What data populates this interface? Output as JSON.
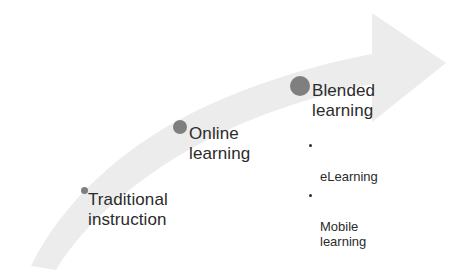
{
  "diagram": {
    "type": "curved-arrow-progression",
    "arrow": {
      "name": "upward-curved-arrow",
      "fill_color": "#ececec",
      "direction": "left-bottom to right-top",
      "tip_label": ""
    },
    "colors": {
      "arrow": "#ececec",
      "dot": "#7f7f7f",
      "text": "#2b2b2b",
      "background": "#ffffff"
    },
    "stages": [
      {
        "id": "traditional",
        "label": "Traditional\ninstruction",
        "dot_size": "small",
        "sub_items": []
      },
      {
        "id": "online",
        "label": "Online\nlearning",
        "dot_size": "medium",
        "sub_items": []
      },
      {
        "id": "blended",
        "label": "Blended\nlearning",
        "dot_size": "large",
        "sub_items": [
          "eLearning",
          "Mobile\nlearning"
        ]
      }
    ]
  }
}
